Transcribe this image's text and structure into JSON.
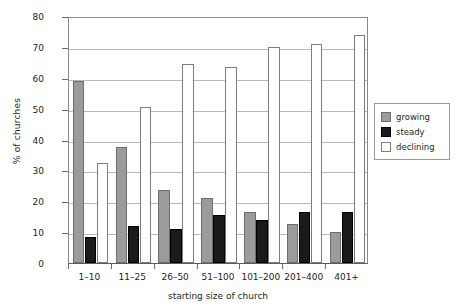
{
  "chart_data": {
    "type": "bar",
    "title": "",
    "xlabel": "starting size of church",
    "ylabel": "% of churches",
    "categories": [
      "1–10",
      "11–25",
      "26–50",
      "51–100",
      "101–200",
      "201–400",
      "401+"
    ],
    "series": [
      {
        "name": "growing",
        "color": "#9b9b9b",
        "values": [
          59,
          37.5,
          23.5,
          21,
          16.5,
          12.5,
          10
        ]
      },
      {
        "name": "steady",
        "color": "#1a1a1a",
        "values": [
          8.5,
          12,
          11,
          15.5,
          14,
          16.5,
          16.5
        ]
      },
      {
        "name": "declining",
        "color": "#ffffff",
        "values": [
          32.5,
          50.5,
          64.5,
          63.5,
          70,
          71,
          74
        ]
      }
    ],
    "ylim": [
      0,
      80
    ],
    "yticks": [
      0,
      10,
      20,
      30,
      40,
      50,
      60,
      70,
      80
    ],
    "ytick_labels": [
      "0",
      "10",
      "20",
      "30",
      "40",
      "50",
      "60",
      "70",
      "80"
    ],
    "grid": true,
    "legend_position": "right"
  },
  "legend": {
    "items": [
      {
        "label": "growing"
      },
      {
        "label": "steady"
      },
      {
        "label": "declining"
      }
    ]
  }
}
